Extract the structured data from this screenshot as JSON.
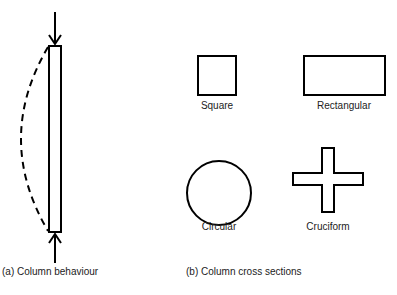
{
  "panel_a": {
    "caption": "(a) Column behaviour",
    "elements": [
      "load-arrow-top",
      "column",
      "buckled-shape-dashed",
      "load-arrow-bottom"
    ]
  },
  "panel_b": {
    "caption": "(b) Column cross sections",
    "sections": [
      {
        "label": "Square"
      },
      {
        "label": "Rectangular"
      },
      {
        "label": "Circular"
      },
      {
        "label": "Cruciform"
      }
    ]
  },
  "colors": {
    "stroke": "#000000",
    "text": "#222222"
  }
}
